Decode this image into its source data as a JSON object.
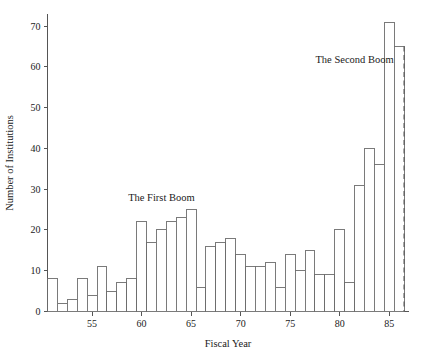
{
  "chart_data": {
    "type": "bar",
    "title": "",
    "subtitle": "",
    "xlabel": "Fiscal Year",
    "ylabel": "Number of Institutions",
    "xlim": [
      50.5,
      87
    ],
    "ylim": [
      0,
      73
    ],
    "grid": false,
    "legend": null,
    "x_ticks": [
      "55",
      "60",
      "65",
      "70",
      "75",
      "80",
      "85"
    ],
    "x_tick_values": [
      55,
      60,
      65,
      70,
      75,
      80,
      85
    ],
    "y_ticks": [
      "0",
      "10",
      "20",
      "30",
      "40",
      "50",
      "60",
      "70"
    ],
    "y_tick_values": [
      0,
      10,
      20,
      30,
      40,
      50,
      60,
      70
    ],
    "categories": [
      51,
      52,
      53,
      54,
      55,
      56,
      57,
      58,
      59,
      60,
      61,
      62,
      63,
      64,
      65,
      66,
      67,
      68,
      69,
      70,
      71,
      72,
      73,
      74,
      75,
      76,
      77,
      78,
      79,
      80,
      81,
      82,
      83,
      84,
      85,
      86
    ],
    "values": [
      8,
      2,
      3,
      8,
      4,
      11,
      5,
      7,
      8,
      22,
      17,
      20,
      22,
      23,
      25,
      6,
      16,
      17,
      18,
      14,
      11,
      11,
      12,
      6,
      14,
      10,
      15,
      9,
      9,
      20,
      7,
      31,
      40,
      36,
      71,
      65
    ],
    "annotations": [
      {
        "text": "The First Boom",
        "x": 62,
        "y": 27,
        "align": "middle"
      },
      {
        "text": "The Second Boom",
        "x": 81.5,
        "y": 61,
        "align": "middle"
      }
    ],
    "reference_lines": [
      {
        "orientation": "vertical",
        "x": 86.5,
        "style": "dashed",
        "y_top": 65,
        "label": ""
      }
    ]
  }
}
